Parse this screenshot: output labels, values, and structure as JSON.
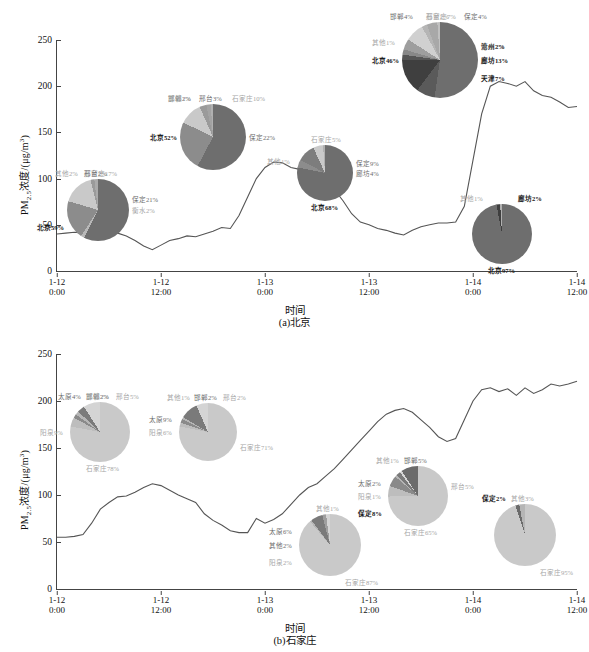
{
  "figure": {
    "axis_y_label_prefix": "PM",
    "axis_y_label_sub": "2.5",
    "axis_y_label_rest": "浓度/(μg/m",
    "axis_y_label_sup": "3",
    "axis_y_label_end": ")",
    "axis_x_label": "时间",
    "y_ticks": [
      "0",
      "50",
      "100",
      "150",
      "200",
      "250"
    ],
    "x_ticks": [
      "1-12\n0:00",
      "1-12\n12:00",
      "1-13\n0:00",
      "1-13\n12:00",
      "1-14\n0:00",
      "1-14\n12:00"
    ],
    "caption_a": "(a)北京",
    "caption_b": "(b)石家庄"
  },
  "colors": {
    "line": "#555555",
    "axis": "#444444",
    "beijing_dark": "#6e6e6e",
    "beijing_mid": "#8c8c8c",
    "beijing_light": "#b8b8b8",
    "sjz_main": "#c9c9c9",
    "sjz_dark": "#7a7a7a",
    "text": "#111111"
  },
  "chart_data": [
    {
      "type": "line",
      "id": "panel-a",
      "title": "(a)北京",
      "xlabel": "时间",
      "ylabel": "PM2.5浓度/(μg/m3)",
      "ylim": [
        0,
        250
      ],
      "xlim": [
        "1-12 0:00",
        "1-14 12:00"
      ],
      "grid": false,
      "legend": "none",
      "x_tick_labels": [
        "1-12 0:00",
        "1-12 12:00",
        "1-13 0:00",
        "1-13 12:00",
        "1-14 0:00",
        "1-14 12:00"
      ],
      "y_tick_values": [
        0,
        50,
        100,
        150,
        200,
        250
      ],
      "series": [
        {
          "name": "北京 PM2.5",
          "x_hours": [
            0,
            1,
            2,
            3,
            4,
            5,
            6,
            7,
            8,
            9,
            10,
            11,
            12,
            13,
            14,
            15,
            16,
            17,
            18,
            19,
            20,
            21,
            22,
            23,
            24,
            25,
            26,
            27,
            28,
            29,
            30,
            31,
            32,
            33,
            34,
            35,
            36,
            37,
            38,
            39,
            40,
            41,
            42,
            43,
            44,
            45,
            46,
            47,
            48,
            49,
            50,
            51,
            52,
            53,
            54,
            55,
            56,
            57,
            58,
            59,
            60
          ],
          "values": [
            40,
            41,
            42,
            41,
            40,
            42,
            44,
            41,
            38,
            33,
            27,
            23,
            28,
            33,
            35,
            38,
            37,
            40,
            43,
            47,
            46,
            60,
            80,
            100,
            112,
            118,
            117,
            112,
            110,
            104,
            96,
            93,
            88,
            76,
            62,
            53,
            50,
            46,
            44,
            41,
            39,
            44,
            48,
            50,
            52,
            52,
            53,
            70,
            120,
            170,
            200,
            205,
            203,
            200,
            205,
            195,
            190,
            188,
            183,
            177,
            178
          ]
        }
      ],
      "pies": [
        {
          "id": "a1",
          "cx": 98,
          "cy": 210,
          "r": 31,
          "slices": [
            {
              "label": "北京59%",
              "value": 59,
              "color": "#6e6e6e",
              "pos": "left-bottom"
            },
            {
              "label": "衡水2%",
              "value": 2,
              "color": "#b8b8b8",
              "pos": "right"
            },
            {
              "label": "保定21%",
              "value": 21,
              "color": "#8c8c8c",
              "pos": "right-top"
            },
            {
              "label": "石家庄17%",
              "value": 17,
              "color": "#c9c9c9",
              "pos": "top"
            },
            {
              "label": "邢台2%",
              "value": 2,
              "color": "#9a9a9a",
              "pos": "top"
            },
            {
              "label": "其他2%",
              "value": 2,
              "color": "#aaaaaa",
              "pos": "top-left"
            }
          ]
        },
        {
          "id": "a2",
          "cx": 213,
          "cy": 137,
          "r": 33,
          "slices": [
            {
              "label": "北京52%",
              "value": 52,
              "color": "#6e6e6e",
              "pos": "left"
            },
            {
              "label": "保定22%",
              "value": 22,
              "color": "#8c8c8c",
              "pos": "right"
            },
            {
              "label": "石家庄10%",
              "value": 10,
              "color": "#c9c9c9",
              "pos": "top-right"
            },
            {
              "label": "邢台3%",
              "value": 3,
              "color": "#9a9a9a",
              "pos": "top"
            },
            {
              "label": "邯郸2%",
              "value": 2,
              "color": "#a3a3a3",
              "pos": "top-left"
            },
            {
              "label": "其他1%",
              "value": 1,
              "color": "#b0b0b0",
              "pos": "top-left"
            }
          ]
        },
        {
          "id": "a3",
          "cx": 325,
          "cy": 173,
          "r": 28,
          "slices": [
            {
              "label": "北京68%",
              "value": 68,
              "color": "#6e6e6e",
              "pos": "bottom"
            },
            {
              "label": "廊坊4%",
              "value": 4,
              "color": "#8c8c8c",
              "pos": "right"
            },
            {
              "label": "保定9%",
              "value": 9,
              "color": "#7d7d7d",
              "pos": "right-top"
            },
            {
              "label": "石家庄5%",
              "value": 5,
              "color": "#c9c9c9",
              "pos": "top"
            },
            {
              "label": "其他1%",
              "value": 1,
              "color": "#b0b0b0",
              "pos": "left-top"
            }
          ]
        },
        {
          "id": "a4",
          "cx": 440,
          "cy": 60,
          "r": 38,
          "slices": [
            {
              "label": "北京46%",
              "value": 46,
              "color": "#6e6e6e",
              "pos": "left"
            },
            {
              "label": "天津7%",
              "value": 7,
              "color": "#5a5a5a",
              "pos": "right-bottom"
            },
            {
              "label": "廊坊13%",
              "value": 13,
              "color": "#3f3f3f",
              "pos": "right"
            },
            {
              "label": "沧州2%",
              "value": 2,
              "color": "#555555",
              "pos": "right-top"
            },
            {
              "label": "衡水2%",
              "value": 2,
              "color": "#888888",
              "pos": "right-top"
            },
            {
              "label": "保定4%",
              "value": 4,
              "color": "#9e9e9e",
              "pos": "top-right"
            },
            {
              "label": "石家庄7%",
              "value": 7,
              "color": "#d0d0d0",
              "pos": "top"
            },
            {
              "label": "邢台2%",
              "value": 2,
              "color": "#b5b5b5",
              "pos": "top"
            },
            {
              "label": "邯郸4%",
              "value": 4,
              "color": "#a8a8a8",
              "pos": "top-left"
            },
            {
              "label": "其他1%",
              "value": 1,
              "color": "#c0c0c0",
              "pos": "left-top"
            }
          ]
        },
        {
          "id": "a5",
          "cx": 502,
          "cy": 234,
          "r": 30,
          "slices": [
            {
              "label": "北京97%",
              "value": 97,
              "color": "#6e6e6e",
              "pos": "bottom"
            },
            {
              "label": "廊坊2%",
              "value": 2,
              "color": "#3f3f3f",
              "pos": "top-right"
            },
            {
              "label": "其他1%",
              "value": 1,
              "color": "#b0b0b0",
              "pos": "top-left"
            }
          ]
        }
      ]
    },
    {
      "type": "line",
      "id": "panel-b",
      "title": "(b)石家庄",
      "xlabel": "时间",
      "ylabel": "PM2.5浓度/(μg/m3)",
      "ylim": [
        0,
        250
      ],
      "xlim": [
        "1-12 0:00",
        "1-14 12:00"
      ],
      "grid": false,
      "legend": "none",
      "x_tick_labels": [
        "1-12 0:00",
        "1-12 12:00",
        "1-13 0:00",
        "1-13 12:00",
        "1-14 0:00",
        "1-14 12:00"
      ],
      "y_tick_values": [
        0,
        50,
        100,
        150,
        200,
        250
      ],
      "series": [
        {
          "name": "石家庄 PM2.5",
          "x_hours": [
            0,
            1,
            2,
            3,
            4,
            5,
            6,
            7,
            8,
            9,
            10,
            11,
            12,
            13,
            14,
            15,
            16,
            17,
            18,
            19,
            20,
            21,
            22,
            23,
            24,
            25,
            26,
            27,
            28,
            29,
            30,
            31,
            32,
            33,
            34,
            35,
            36,
            37,
            38,
            39,
            40,
            41,
            42,
            43,
            44,
            45,
            46,
            47,
            48,
            49,
            50,
            51,
            52,
            53,
            54,
            55,
            56,
            57,
            58,
            59,
            60
          ],
          "values": [
            55,
            55,
            56,
            58,
            70,
            85,
            92,
            98,
            99,
            103,
            108,
            112,
            110,
            105,
            100,
            96,
            92,
            80,
            73,
            68,
            62,
            60,
            60,
            75,
            70,
            74,
            80,
            90,
            100,
            108,
            112,
            120,
            128,
            138,
            148,
            158,
            168,
            178,
            186,
            190,
            192,
            188,
            180,
            172,
            162,
            157,
            160,
            180,
            200,
            212,
            214,
            210,
            213,
            206,
            214,
            208,
            212,
            218,
            216,
            218,
            221
          ]
        }
      ],
      "pies": [
        {
          "id": "b1",
          "cx": 100,
          "cy": 432,
          "r": 30,
          "slices": [
            {
              "label": "石家庄78%",
              "value": 78,
              "color": "#c9c9c9",
              "pos": "bottom"
            },
            {
              "label": "邢台5%",
              "value": 5,
              "color": "#bdbdbd",
              "pos": "top-right"
            },
            {
              "label": "邯郸2%",
              "value": 2,
              "color": "#8a8a8a",
              "pos": "top"
            },
            {
              "label": "其他2%",
              "value": 2,
              "color": "#b5b5b5",
              "pos": "top"
            },
            {
              "label": "太原4%",
              "value": 4,
              "color": "#7a7a7a",
              "pos": "top-left"
            },
            {
              "label": "阳泉9%",
              "value": 9,
              "color": "#d4d4d4",
              "pos": "left"
            }
          ]
        },
        {
          "id": "b2",
          "cx": 208,
          "cy": 432,
          "r": 29,
          "slices": [
            {
              "label": "石家庄71%",
              "value": 71,
              "color": "#c9c9c9",
              "pos": "right-bottom"
            },
            {
              "label": "邢台2%",
              "value": 2,
              "color": "#bdbdbd",
              "pos": "top-right"
            },
            {
              "label": "邯郸2%",
              "value": 2,
              "color": "#8a8a8a",
              "pos": "top"
            },
            {
              "label": "其他1%",
              "value": 1,
              "color": "#b5b5b5",
              "pos": "top-left"
            },
            {
              "label": "太原9%",
              "value": 9,
              "color": "#7a7a7a",
              "pos": "left-top"
            },
            {
              "label": "阳泉6%",
              "value": 6,
              "color": "#d4d4d4",
              "pos": "left"
            }
          ]
        },
        {
          "id": "b3",
          "cx": 330,
          "cy": 545,
          "r": 31,
          "slices": [
            {
              "label": "石家庄87%",
              "value": 87,
              "color": "#c9c9c9",
              "pos": "bottom-right"
            },
            {
              "label": "其他1%",
              "value": 1,
              "color": "#b5b5b5",
              "pos": "top"
            },
            {
              "label": "太原6%",
              "value": 6,
              "color": "#7a7a7a",
              "pos": "left-top"
            },
            {
              "label": "其他2%",
              "value": 2,
              "color": "#9e9e9e",
              "pos": "left"
            },
            {
              "label": "阳泉2%",
              "value": 2,
              "color": "#d4d4d4",
              "pos": "left-bottom"
            }
          ]
        },
        {
          "id": "b4",
          "cx": 418,
          "cy": 496,
          "r": 30,
          "slices": [
            {
              "label": "石家庄65%",
              "value": 65,
              "color": "#c9c9c9",
              "pos": "bottom"
            },
            {
              "label": "邢台5%",
              "value": 5,
              "color": "#bdbdbd",
              "pos": "right-top"
            },
            {
              "label": "邯郸5%",
              "value": 5,
              "color": "#8a8a8a",
              "pos": "top"
            },
            {
              "label": "其他1%",
              "value": 1,
              "color": "#b5b5b5",
              "pos": "top-left"
            },
            {
              "label": "太原2%",
              "value": 2,
              "color": "#7a7a7a",
              "pos": "left-top"
            },
            {
              "label": "阳泉1%",
              "value": 1,
              "color": "#d4d4d4",
              "pos": "left"
            },
            {
              "label": "保定8%",
              "value": 8,
              "color": "#6b6b6b",
              "pos": "left-bottom"
            }
          ]
        },
        {
          "id": "b5",
          "cx": 525,
          "cy": 535,
          "r": 31,
          "slices": [
            {
              "label": "石家庄95%",
              "value": 95,
              "color": "#c9c9c9",
              "pos": "bottom-right"
            },
            {
              "label": "保定2%",
              "value": 2,
              "color": "#6b6b6b",
              "pos": "top-left"
            },
            {
              "label": "其他3%",
              "value": 3,
              "color": "#b5b5b5",
              "pos": "top"
            }
          ]
        }
      ]
    }
  ]
}
